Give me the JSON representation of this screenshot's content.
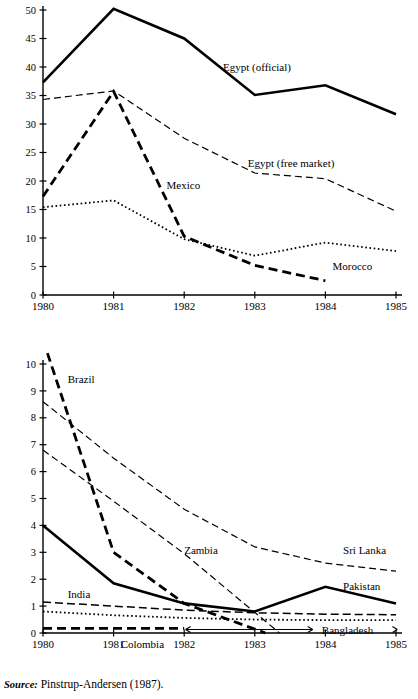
{
  "figure": {
    "source_prefix": "Source:",
    "source_text": "Pinstrup-Andersen (1987)."
  },
  "chart_data": [
    {
      "id": "top",
      "type": "line",
      "title": "",
      "subtitle": "",
      "xlabel": "",
      "ylabel": "",
      "x": [
        1980,
        1981,
        1982,
        1983,
        1984,
        1985
      ],
      "xtick_labels": [
        "1980",
        "1981",
        "1982",
        "1983",
        "1984",
        "1985"
      ],
      "xlim": [
        1980,
        1985
      ],
      "ylim": [
        0,
        50
      ],
      "ytick_labels": [
        "0",
        "5",
        "10",
        "15",
        "20",
        "25",
        "30",
        "35",
        "40",
        "45",
        "50"
      ],
      "yticks": [
        0,
        5,
        10,
        15,
        20,
        25,
        30,
        35,
        40,
        45,
        50
      ],
      "grid": false,
      "legend_position": "inline-annotations",
      "series": [
        {
          "name": "Egypt (official)",
          "style": "solid-thick",
          "x": [
            1980,
            1981,
            1982,
            1983,
            1984,
            1985
          ],
          "values": [
            37.3,
            50.2,
            45.0,
            35.1,
            36.8,
            31.7
          ],
          "label_x": 1982.55,
          "label_y": 40.0
        },
        {
          "name": "Egypt  (free market)",
          "style": "dashed-thin",
          "x": [
            1980,
            1981,
            1982,
            1983,
            1984,
            1985
          ],
          "values": [
            34.3,
            35.8,
            27.5,
            21.4,
            20.4,
            14.7
          ],
          "label_x": 1982.9,
          "label_y": 23.2
        },
        {
          "name": "Mexico",
          "style": "dashed-thick",
          "x": [
            1980,
            1981,
            1982,
            1983,
            1984
          ],
          "values": [
            17.3,
            35.7,
            10.3,
            5.2,
            2.5
          ],
          "label_x": 1981.75,
          "label_y": 19.3
        },
        {
          "name": "Morocco",
          "style": "dotted",
          "x": [
            1980,
            1981,
            1982,
            1983,
            1984,
            1985
          ],
          "values": [
            15.4,
            16.6,
            9.8,
            6.9,
            9.2,
            7.7
          ],
          "label_x": 1984.1,
          "label_y": 5.1
        }
      ]
    },
    {
      "id": "bottom",
      "type": "line",
      "title": "",
      "subtitle": "",
      "xlabel": "",
      "ylabel": "",
      "x": [
        1980,
        1981,
        1982,
        1983,
        1984,
        1985
      ],
      "xtick_labels": [
        "1980",
        "1981",
        "1982",
        "1983",
        "1984",
        "1985"
      ],
      "xlim": [
        1980,
        1985
      ],
      "ylim": [
        0,
        10
      ],
      "ytick_labels": [
        "0",
        "1",
        "2",
        "3",
        "4",
        "5",
        "6",
        "7",
        "8",
        "9",
        "10"
      ],
      "yticks": [
        0,
        1,
        2,
        3,
        4,
        5,
        6,
        7,
        8,
        9,
        10
      ],
      "grid": false,
      "legend_position": "inline-annotations",
      "series": [
        {
          "name": "Brazil",
          "style": "dashed-thick",
          "x": [
            1980,
            1981,
            1982,
            1983.15
          ],
          "values": [
            10.9,
            3.0,
            1.1,
            0.0
          ],
          "label_x": 1980.35,
          "label_y": 9.45
        },
        {
          "name": "Sri Lanka",
          "style": "dashed-thin",
          "x": [
            1980,
            1981,
            1982,
            1983,
            1984,
            1985
          ],
          "values": [
            8.6,
            6.5,
            4.6,
            3.2,
            2.6,
            2.3
          ],
          "label_x": 1984.25,
          "label_y": 3.1
        },
        {
          "name": "Zambia",
          "style": "dashed-thin",
          "x": [
            1980,
            1981,
            1982,
            1983.35
          ],
          "values": [
            6.8,
            4.9,
            2.95,
            0.0
          ],
          "label_x": 1982.0,
          "label_y": 3.1
        },
        {
          "name": "Pakistan",
          "style": "solid-thick",
          "x": [
            1980,
            1981,
            1982,
            1983,
            1984,
            1985
          ],
          "values": [
            4.0,
            1.85,
            1.1,
            0.8,
            1.72,
            1.1
          ],
          "label_x": 1984.25,
          "label_y": 1.75
        },
        {
          "name": "India",
          "style": "dashed-medium",
          "x": [
            1980,
            1981,
            1982,
            1983,
            1984,
            1985
          ],
          "values": [
            1.15,
            1.0,
            0.85,
            0.75,
            0.7,
            0.68
          ],
          "label_x": 1980.35,
          "label_y": 1.45
        },
        {
          "name": "Colombia",
          "style": "dotted",
          "x": [
            1980,
            1981,
            1982,
            1983,
            1984,
            1985
          ],
          "values": [
            0.8,
            0.66,
            0.56,
            0.5,
            0.48,
            0.48
          ],
          "label_x": 1981.1,
          "label_y": -0.42
        },
        {
          "name": "Bangladesh",
          "style": "dashed-thick",
          "x": [
            1980,
            1981,
            1982
          ],
          "values": [
            0.17,
            0.17,
            0.17
          ],
          "label_x": 1983.95,
          "label_y": 0.13
        }
      ]
    }
  ]
}
